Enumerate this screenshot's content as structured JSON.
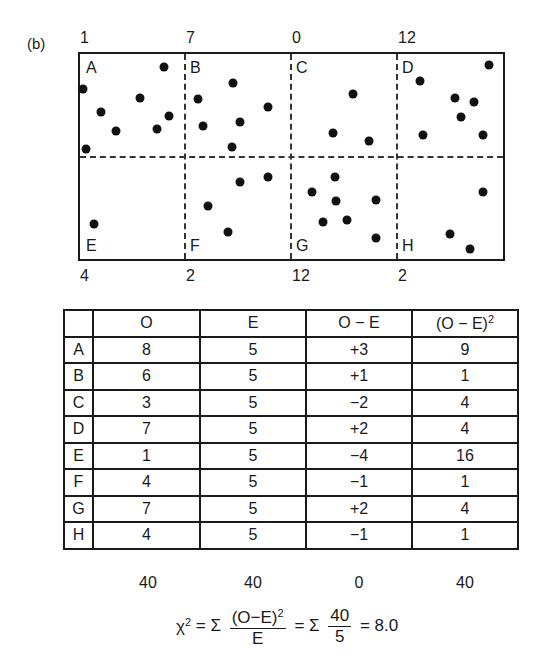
{
  "figure_label": "(b)",
  "quadrats": {
    "top_counts": [
      "1",
      "7",
      "0",
      "12"
    ],
    "bottom_counts": [
      "4",
      "2",
      "12",
      "2"
    ],
    "labels": [
      "A",
      "B",
      "C",
      "D",
      "E",
      "F",
      "G",
      "H"
    ]
  },
  "table": {
    "headers": [
      "",
      "O",
      "E",
      "O − E",
      "(O − E)",
      "2"
    ],
    "rows": [
      {
        "q": "A",
        "o": "8",
        "e": "5",
        "diff": "+3",
        "sq": "9"
      },
      {
        "q": "B",
        "o": "6",
        "e": "5",
        "diff": "+1",
        "sq": "1"
      },
      {
        "q": "C",
        "o": "3",
        "e": "5",
        "diff": "−2",
        "sq": "4"
      },
      {
        "q": "D",
        "o": "7",
        "e": "5",
        "diff": "+2",
        "sq": "4"
      },
      {
        "q": "E",
        "o": "1",
        "e": "5",
        "diff": "−4",
        "sq": "16"
      },
      {
        "q": "F",
        "o": "4",
        "e": "5",
        "diff": "−1",
        "sq": "1"
      },
      {
        "q": "G",
        "o": "7",
        "e": "5",
        "diff": "+2",
        "sq": "4"
      },
      {
        "q": "H",
        "o": "4",
        "e": "5",
        "diff": "−1",
        "sq": "1"
      }
    ],
    "totals": [
      "40",
      "40",
      "0",
      "40"
    ]
  },
  "formula": {
    "chi": "χ",
    "chi_exp": "2",
    "eq1": "= Σ",
    "frac1_num": "(O−E)",
    "frac1_num_exp": "2",
    "frac1_den": "E",
    "eq2": "= Σ",
    "frac2_num": "40",
    "frac2_den": "5",
    "result": "= 8.0"
  }
}
